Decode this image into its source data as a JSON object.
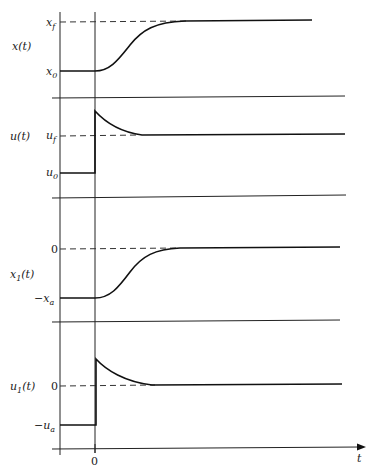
{
  "diagram": {
    "type": "time-response plots",
    "x_axis_label": "t",
    "t0_tick_label": "0",
    "panels": [
      {
        "id": "x",
        "ylabel": "x(t)",
        "levels": [
          {
            "name": "final",
            "label": "x_f",
            "label_main": "x",
            "label_sub": "f"
          },
          {
            "name": "initial",
            "label": "x_0",
            "label_main": "x",
            "label_sub": "0"
          }
        ],
        "shape": "smooth S-curve rising from x_0 to x_f after t=0"
      },
      {
        "id": "u",
        "ylabel": "u(t)",
        "levels": [
          {
            "name": "final",
            "label": "u_f",
            "label_main": "u",
            "label_sub": "f"
          },
          {
            "name": "initial",
            "label": "u_0",
            "label_main": "u",
            "label_sub": "0"
          }
        ],
        "shape": "step up at t=0 overshooting, then exponential decay to u_f"
      },
      {
        "id": "x1",
        "ylabel": "x1(t)",
        "ylabel_main": "x",
        "ylabel_sub": "1",
        "levels": [
          {
            "name": "final",
            "label": "0"
          },
          {
            "name": "initial",
            "label": "-x_a",
            "label_main": "−x",
            "label_sub": "a"
          }
        ],
        "shape": "smooth S-curve rising from -x_a to 0 after t=0"
      },
      {
        "id": "u1",
        "ylabel": "u1(t)",
        "ylabel_main": "u",
        "ylabel_sub": "1",
        "levels": [
          {
            "name": "final",
            "label": "0"
          },
          {
            "name": "initial",
            "label": "-u_a",
            "label_main": "−u",
            "label_sub": "a"
          }
        ],
        "shape": "step up at t=0 overshooting, then exponential decay to 0"
      }
    ]
  }
}
